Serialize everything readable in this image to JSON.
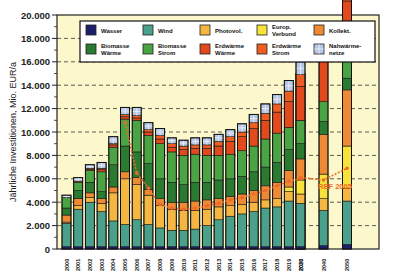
{
  "chart_data": {
    "type": "bar",
    "stacked": true,
    "title": "",
    "xlabel": "",
    "ylabel": "Jährliche Investitionen, Mio. EUR/a",
    "ylim": [
      0,
      20000
    ],
    "yticks": [
      "0",
      "2.000",
      "4.000",
      "6.000",
      "8.000",
      "10.000",
      "12.000",
      "14.000",
      "16.000",
      "18.000",
      "20.000"
    ],
    "grid": "horizontal dashed",
    "legend_position": "top inside",
    "categories": [
      "2000",
      "2001",
      "2002",
      "2003",
      "2004",
      "2005",
      "2006",
      "2007",
      "2008",
      "2009",
      "2010",
      "2011",
      "2012",
      "2013",
      "2014",
      "2015",
      "2016",
      "2017",
      "2018",
      "2019",
      "2020",
      "2030",
      "2040",
      "2050"
    ],
    "series": [
      {
        "name": "Wasser",
        "color": "#1c1f6b",
        "values": [
          200,
          200,
          200,
          200,
          200,
          200,
          200,
          200,
          200,
          200,
          200,
          200,
          200,
          200,
          200,
          200,
          200,
          200,
          200,
          200,
          200,
          200,
          300,
          400
        ]
      },
      {
        "name": "Wind",
        "color": "#4aa08a",
        "values": [
          2000,
          3200,
          3800,
          3000,
          2200,
          1900,
          2300,
          1900,
          1600,
          1400,
          1400,
          1500,
          1800,
          2300,
          2600,
          2800,
          3000,
          3300,
          3400,
          3900,
          3900,
          3700,
          3000,
          3700
        ]
      },
      {
        "name": "Photovol.",
        "color": "#f5b742",
        "values": [
          100,
          300,
          400,
          700,
          2400,
          3900,
          3000,
          2500,
          1900,
          1800,
          1700,
          1600,
          1400,
          1100,
          900,
          800,
          800,
          700,
          700,
          800,
          800,
          800,
          1000,
          1100
        ]
      },
      {
        "name": "Europ. Verbund",
        "color": "#f6e23a",
        "values": [
          0,
          0,
          0,
          0,
          0,
          0,
          0,
          0,
          0,
          0,
          0,
          0,
          0,
          0,
          0,
          0,
          0,
          0,
          0,
          400,
          600,
          1200,
          2100,
          3600
        ]
      },
      {
        "name": "Kollekt.",
        "color": "#ef8a34",
        "values": [
          600,
          600,
          400,
          400,
          500,
          600,
          600,
          500,
          600,
          600,
          700,
          800,
          800,
          700,
          800,
          900,
          1000,
          1200,
          1400,
          1400,
          1500,
          1800,
          3400,
          4800
        ]
      },
      {
        "name": "Biomasse Wärme",
        "color": "#2a7a32",
        "values": [
          600,
          700,
          900,
          600,
          1900,
          2200,
          2200,
          2200,
          1700,
          1700,
          1500,
          1600,
          1500,
          1600,
          1500,
          1500,
          1600,
          1600,
          1700,
          1800,
          1700,
          1300,
          1100,
          1000
        ]
      },
      {
        "name": "Biomasse Strom",
        "color": "#4aa443",
        "values": [
          900,
          700,
          1000,
          1700,
          1500,
          2300,
          2700,
          2400,
          3000,
          2600,
          2500,
          2400,
          2300,
          2100,
          2100,
          2200,
          2200,
          2400,
          2500,
          1900,
          1900,
          2000,
          1700,
          2200
        ]
      },
      {
        "name": "Erdwärme Wärme",
        "color": "#e24a1e",
        "values": [
          0,
          100,
          100,
          200,
          200,
          200,
          200,
          300,
          400,
          400,
          500,
          500,
          600,
          800,
          1100,
          1200,
          1500,
          1600,
          1800,
          2200,
          2500,
          2900,
          3600,
          4400
        ]
      },
      {
        "name": "Erdwärme Strom",
        "color": "#ee5e22",
        "values": [
          0,
          0,
          100,
          100,
          100,
          200,
          200,
          200,
          300,
          300,
          300,
          300,
          300,
          400,
          400,
          400,
          500,
          600,
          700,
          900,
          1000,
          1000,
          1200,
          1300
        ]
      },
      {
        "name": "Nahwärmenetze",
        "color": "#b7c8e6",
        "values": [
          200,
          300,
          300,
          500,
          600,
          600,
          700,
          600,
          600,
          500,
          500,
          600,
          600,
          600,
          600,
          700,
          700,
          800,
          800,
          900,
          900,
          1100,
          1800,
          2500
        ]
      }
    ],
    "totals_approx": [
      4600,
      6100,
      6800,
      7300,
      9500,
      11200,
      10800,
      9700,
      9000,
      8500,
      8200,
      8200,
      8300,
      8300,
      8500,
      8900,
      9500,
      10300,
      11200,
      12400,
      13100,
      14500,
      17800,
      20000
    ],
    "reference_line": {
      "label": "REF 2005",
      "color": "#ee6a2a",
      "style": "dotted with markers",
      "categories": [
        "2005",
        "2006",
        "2007",
        "2008",
        "2009",
        "2010",
        "2011",
        "2012",
        "2013",
        "2014",
        "2015",
        "2016",
        "2017",
        "2018",
        "2019",
        "2020",
        "2030",
        "2040",
        "2050"
      ],
      "values": [
        10800,
        6500,
        5200,
        3800,
        3500,
        3400,
        3500,
        3700,
        3900,
        4200,
        4400,
        4700,
        5000,
        5400,
        5800,
        6000,
        6100,
        5900,
        6900
      ]
    }
  }
}
